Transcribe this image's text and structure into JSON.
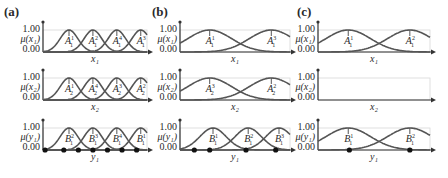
{
  "figure": {
    "panels": [
      {
        "label": "(a)",
        "rows": [
          {
            "ylabel": "μ(x₁)",
            "ytick_top": "1.00",
            "ytick_bottom": "0.00",
            "xlabel": "x₁",
            "sets": [
              {
                "base": "A",
                "sup": "1",
                "sub": "1"
              },
              {
                "base": "A",
                "sup": "2",
                "sub": "1"
              },
              {
                "base": "A",
                "sup": "4",
                "sub": "1"
              },
              {
                "base": "A",
                "sup": "3",
                "sub": "1"
              }
            ]
          },
          {
            "ylabel": "μ(x₂)",
            "ytick_top": "1.00",
            "ytick_bottom": "0.00",
            "xlabel": "x₂",
            "sets": [
              {
                "base": "A",
                "sup": "1",
                "sub": "2"
              },
              {
                "base": "A",
                "sup": "4",
                "sub": "2"
              },
              {
                "base": "A",
                "sup": "3",
                "sub": "2"
              },
              {
                "base": "A",
                "sup": "2",
                "sub": "2"
              }
            ]
          },
          {
            "ylabel": "μ(y₁)",
            "ytick_top": "1.00",
            "ytick_bottom": "0.00",
            "xlabel": "y₁",
            "sets": [
              {
                "base": "B",
                "sup": "2",
                "sub": "1"
              },
              {
                "base": "B",
                "sup": "3",
                "sub": "1"
              },
              {
                "base": "B",
                "sup": "4",
                "sub": "1"
              },
              {
                "base": "B",
                "sup": "1",
                "sub": "1"
              }
            ]
          }
        ]
      },
      {
        "label": "(b)",
        "rows": [
          {
            "ylabel": "μ(x₁)",
            "ytick_top": "1.00",
            "ytick_bottom": "0.00",
            "xlabel": "x₁",
            "sets": [
              {
                "base": "A",
                "sup": "1",
                "sub": "1"
              },
              {
                "base": "A",
                "sup": "3",
                "sub": "1"
              }
            ]
          },
          {
            "ylabel": "μ(x₂)",
            "ytick_top": "1.00",
            "ytick_bottom": "0.00",
            "xlabel": "x₂",
            "sets": [
              {
                "base": "A",
                "sup": "3",
                "sub": "2"
              },
              {
                "base": "A",
                "sup": "2",
                "sub": "2"
              }
            ]
          },
          {
            "ylabel": "μ(y₁)",
            "ytick_top": "1.00",
            "ytick_bottom": "0.00",
            "xlabel": "y₁",
            "sets": [
              {
                "base": "B",
                "sup": "1",
                "sub": "1"
              },
              {
                "base": "B",
                "sup": "2",
                "sub": "1"
              },
              {
                "base": "B",
                "sup": "3",
                "sub": "1"
              }
            ]
          }
        ]
      },
      {
        "label": "(c)",
        "rows": [
          {
            "ylabel": "μ(x₁)",
            "ytick_top": "1.00",
            "ytick_bottom": "0.00",
            "xlabel": "x₁",
            "sets": [
              {
                "base": "A",
                "sup": "1",
                "sub": "1"
              },
              {
                "base": "A",
                "sup": "2",
                "sub": "1"
              }
            ]
          },
          {
            "ylabel": "μ(x₂)",
            "ytick_top": "1.00",
            "ytick_bottom": "0.00",
            "xlabel": "x₂",
            "sets": []
          },
          {
            "ylabel": "μ(y₁)",
            "ytick_top": "1.00",
            "ytick_bottom": "0.00",
            "xlabel": "y₁",
            "sets": [
              {
                "base": "B",
                "sup": "1",
                "sub": "1"
              },
              {
                "base": "B",
                "sup": "2",
                "sub": "1"
              }
            ]
          }
        ]
      }
    ],
    "colors": {
      "curve": "#555555",
      "axis": "#333333",
      "grid": "#d8d8d8",
      "dot": "#111111"
    }
  }
}
